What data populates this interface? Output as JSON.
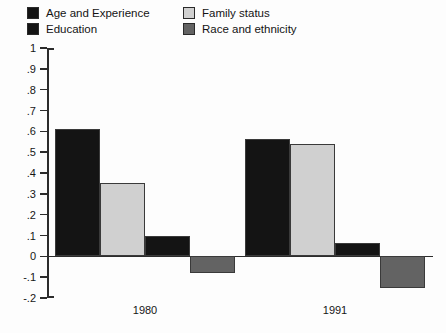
{
  "chart_data": {
    "type": "bar",
    "title": "",
    "xlabel": "",
    "ylabel": "",
    "categories": [
      "1980",
      "1991"
    ],
    "ylim": [
      -0.2,
      1
    ],
    "ytick_values": [
      1,
      0.9,
      0.8,
      0.7,
      0.6,
      0.5,
      0.4,
      0.3,
      0.2,
      0.1,
      0,
      -0.1,
      -0.2
    ],
    "ytick_labels": [
      "1",
      ".9",
      ".8",
      ".7",
      ".6",
      ".5",
      ".4",
      ".3",
      ".2",
      ".1",
      "0",
      "-.1",
      "-.2"
    ],
    "grid": false,
    "legend_position": "above-plot",
    "zero_line": true,
    "series": [
      {
        "name": "Age and Experience",
        "color": "#141414",
        "values": [
          0.61,
          0.565
        ]
      },
      {
        "name": "Family status",
        "color": "#d0d0d0",
        "values": [
          0.35,
          0.54
        ]
      },
      {
        "name": "Education",
        "color": "#141414",
        "values": [
          0.1,
          0.065
        ]
      },
      {
        "name": "Race and ethnicity",
        "color": "#636363",
        "values": [
          -0.08,
          -0.15
        ]
      }
    ]
  },
  "legend": {
    "entries": [
      {
        "label": "Age and Experience",
        "color": "#141414",
        "row": 0,
        "col": 0
      },
      {
        "label": "Education",
        "color": "#141414",
        "row": 1,
        "col": 0
      },
      {
        "label": "Family status",
        "color": "#d0d0d0",
        "row": 0,
        "col": 1
      },
      {
        "label": "Race and ethnicity",
        "color": "#636363",
        "row": 1,
        "col": 1
      }
    ]
  },
  "colors": {
    "dark": "#141414",
    "light_gray": "#d0d0d0",
    "mid_gray": "#636363",
    "axis": "#2c2c2c",
    "background": "#fdfdfd",
    "bar_outline": "#3a3a3a"
  }
}
